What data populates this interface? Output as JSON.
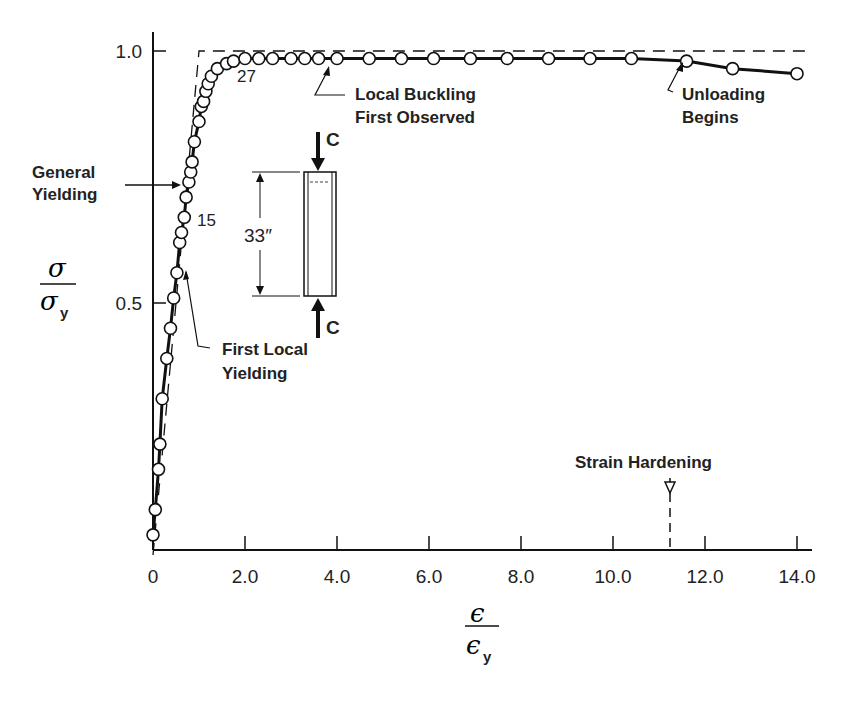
{
  "chart_data": {
    "type": "scatter",
    "title": "",
    "xlabel": "ε / ε_y",
    "ylabel": "σ / σ_y",
    "xlim": [
      0,
      14.2
    ],
    "ylim": [
      0,
      1.0
    ],
    "x_ticks": [
      {
        "value": 0,
        "label": "0"
      },
      {
        "value": 2,
        "label": "2.0"
      },
      {
        "value": 4,
        "label": "4.0"
      },
      {
        "value": 6,
        "label": "6.0"
      },
      {
        "value": 8,
        "label": "8.0"
      },
      {
        "value": 10,
        "label": "10.0"
      },
      {
        "value": 12,
        "label": "12.0"
      },
      {
        "value": 14,
        "label": "14.0"
      }
    ],
    "y_ticks": [
      {
        "value": 0.5,
        "label": "0.5"
      },
      {
        "value": 1.0,
        "label": "1.0"
      }
    ],
    "grid": false,
    "series": [
      {
        "name": "Test data",
        "marker": "open-circle",
        "line": "solid",
        "x": [
          0.0,
          0.05,
          0.12,
          0.15,
          0.2,
          0.3,
          0.38,
          0.45,
          0.52,
          0.58,
          0.62,
          0.68,
          0.72,
          0.78,
          0.82,
          0.85,
          0.9,
          1.0,
          1.05,
          1.1,
          1.15,
          1.2,
          1.27,
          1.4,
          1.6,
          1.75,
          2.0,
          2.3,
          2.6,
          3.0,
          3.3,
          3.6,
          4.0,
          4.7,
          5.4,
          6.1,
          6.9,
          7.7,
          8.6,
          9.5,
          10.4,
          11.6,
          12.6,
          14.0
        ],
        "y": [
          0.04,
          0.09,
          0.17,
          0.22,
          0.31,
          0.39,
          0.45,
          0.51,
          0.56,
          0.62,
          0.64,
          0.67,
          0.71,
          0.74,
          0.76,
          0.78,
          0.82,
          0.86,
          0.89,
          0.9,
          0.92,
          0.935,
          0.95,
          0.965,
          0.975,
          0.98,
          0.985,
          0.985,
          0.985,
          0.985,
          0.985,
          0.985,
          0.985,
          0.985,
          0.985,
          0.985,
          0.985,
          0.985,
          0.985,
          0.985,
          0.985,
          0.98,
          0.965,
          0.955
        ]
      },
      {
        "name": "Idealized elastic-plastic",
        "line": "dashed",
        "x": [
          0.0,
          1.0,
          14.2
        ],
        "y": [
          0.0,
          1.0,
          1.0
        ]
      }
    ],
    "annotations": [
      {
        "text": "General Yielding",
        "points_to": {
          "x": 0.67,
          "y": 0.73
        }
      },
      {
        "text": "15",
        "near": {
          "x": 0.8,
          "y": 0.66
        }
      },
      {
        "text": "27",
        "near": {
          "x": 2.1,
          "y": 0.93
        }
      },
      {
        "text": "First Local Yielding",
        "points_to": {
          "x": 0.7,
          "y": 0.56
        }
      },
      {
        "text": "Local Buckling First Observed",
        "points_to": {
          "x": 3.6,
          "y": 0.985
        }
      },
      {
        "text": "Unloading Begins",
        "points_to": {
          "x": 11.6,
          "y": 0.98
        }
      },
      {
        "text": "Strain Hardening",
        "marker_x": 11.3
      },
      {
        "text": "33″",
        "role": "specimen length"
      },
      {
        "text": "C",
        "role": "compression load, top"
      },
      {
        "text": "C",
        "role": "compression load, bottom"
      }
    ]
  },
  "labels": {
    "y_num": "σ",
    "y_den": "σ",
    "y_sub": "y",
    "x_num": "ϵ",
    "x_den": "ϵ",
    "x_sub": "y",
    "general_1": "General",
    "general_2": "Yielding",
    "first_local_1": "First Local",
    "first_local_2": "Yielding",
    "buckling_1": "Local Buckling",
    "buckling_2": "First Observed",
    "unloading_1": "Unloading",
    "unloading_2": "Begins",
    "strain_hardening": "Strain Hardening",
    "pt15": "15",
    "pt27": "27",
    "length": "33″",
    "load_top": "C",
    "load_bottom": "C"
  }
}
